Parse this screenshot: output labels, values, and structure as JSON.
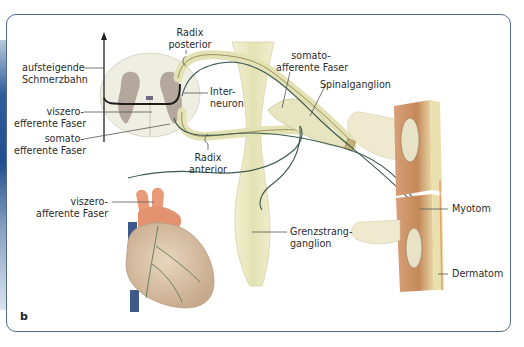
{
  "figure": {
    "panel_letter": "b",
    "border_color": "#4f6a8c"
  },
  "labels": {
    "aufsteigende_schmerzbahn": [
      "aufsteigende",
      "Schmerzbahn"
    ],
    "viszero_efferente": [
      "viszero-",
      "efferente Faser"
    ],
    "somato_efferente": [
      "somato-",
      "efferente Faser"
    ],
    "radix_posterior": [
      "Radix",
      "posterior"
    ],
    "interneuron": [
      "Inter-",
      "neuron"
    ],
    "radix_anterior": [
      "Radix",
      "anterior"
    ],
    "somato_afferente": [
      "somato-",
      "afferente Faser"
    ],
    "spinalganglion": [
      "Spinalganglion"
    ],
    "viszero_afferente": [
      "viszero-",
      "afferente Faser"
    ],
    "grenzstrangganglion": [
      "Grenzstrang-",
      "ganglion"
    ],
    "myotom": [
      "Myotom"
    ],
    "dermatom": [
      "Dermatom"
    ]
  },
  "colors": {
    "nerve_fill": "#e6e6b8",
    "nerve_dark": "#3e5a50",
    "spinal_cord_white": "#eeeee2",
    "spinal_cord_grey": "#a89a92",
    "heart": "#d9c2a6",
    "aorta": "#e99a78",
    "muscle": "#c98e5e",
    "bone": "#efe9cf",
    "vein": "#3d5a8a"
  }
}
